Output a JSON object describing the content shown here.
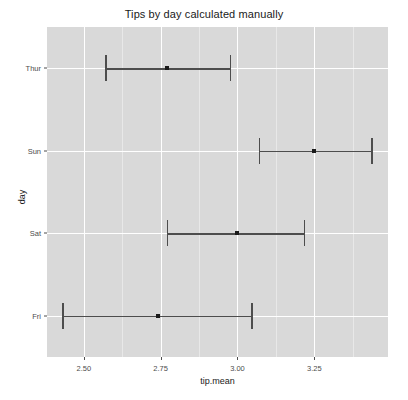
{
  "chart_data": {
    "type": "scatter",
    "title": "Tips by day calculated manually",
    "xlabel": "tip.mean",
    "ylabel": "day",
    "orientation": "horizontal",
    "grid": true,
    "legend": "none",
    "xlim": [
      2.38,
      3.49
    ],
    "xticks": [
      "2.50",
      "2.75",
      "3.00",
      "3.25"
    ],
    "xtick_values": [
      2.5,
      2.75,
      3.0,
      3.25
    ],
    "categories": [
      "Thur",
      "Sun",
      "Sat",
      "Fri"
    ],
    "points": [
      {
        "category": "Thur",
        "value": 2.77,
        "lower": 2.57,
        "upper": 2.98
      },
      {
        "category": "Sun",
        "value": 3.25,
        "lower": 3.07,
        "upper": 3.44
      },
      {
        "category": "Sat",
        "value": 3.0,
        "lower": 2.77,
        "upper": 3.22
      },
      {
        "category": "Fri",
        "value": 2.74,
        "lower": 2.43,
        "upper": 3.05
      }
    ],
    "colors": {
      "panel_background": "#d9d9d9",
      "grid_major": "#ffffff",
      "grid_minor": "#e8e8e8",
      "marker": "#1a1a1a",
      "errorbar": "#4d4d4d",
      "page_background": "#ffffff",
      "text": "#1a1a1a",
      "axis_text": "#4d4d4d"
    }
  }
}
